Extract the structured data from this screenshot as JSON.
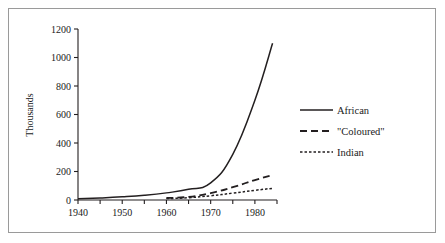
{
  "chart_data": {
    "type": "line",
    "title": "",
    "xlabel": "",
    "ylabel": "Thousands",
    "xlim": [
      1940,
      1985
    ],
    "ylim": [
      0,
      1200
    ],
    "grid": false,
    "legend_position": "right-middle",
    "x_ticks": [
      1940,
      1945,
      1950,
      1955,
      1960,
      1965,
      1970,
      1975,
      1980,
      1985
    ],
    "x_tick_labels": [
      "1940",
      "",
      "1950",
      "",
      "1960",
      "",
      "1970",
      "",
      "1980",
      ""
    ],
    "y_ticks": [
      0,
      200,
      400,
      600,
      800,
      1000,
      1200
    ],
    "y_tick_labels": [
      "0",
      "200",
      "400",
      "600",
      "800",
      "1000",
      "1200"
    ],
    "series": [
      {
        "name": "African",
        "style": "solid",
        "x": [
          1940,
          1945,
          1950,
          1955,
          1960,
          1965,
          1970,
          1975,
          1980,
          1984
        ],
        "values": [
          8,
          14,
          22,
          33,
          50,
          75,
          120,
          320,
          700,
          1100
        ]
      },
      {
        "name": "\"Coloured\"",
        "style": "dashed",
        "x": [
          1960,
          1965,
          1970,
          1975,
          1980,
          1984
        ],
        "values": [
          14,
          22,
          48,
          90,
          140,
          175
        ]
      },
      {
        "name": "Indian",
        "style": "dotted",
        "x": [
          1960,
          1965,
          1970,
          1975,
          1980,
          1984
        ],
        "values": [
          10,
          16,
          30,
          48,
          68,
          82
        ]
      }
    ]
  },
  "axis": {
    "y_title": "Thousands"
  },
  "legend": {
    "entries": [
      {
        "label": "African",
        "style": "solid"
      },
      {
        "label": "\"Coloured\"",
        "style": "dashed"
      },
      {
        "label": "Indian",
        "style": "dotted"
      }
    ]
  },
  "colors": {
    "line": "#231f20",
    "border": "#9a9a9a",
    "background": "#ffffff"
  }
}
